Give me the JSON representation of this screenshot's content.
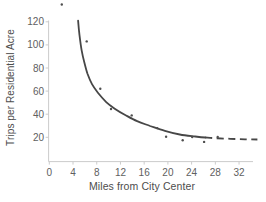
{
  "colors": {
    "background": "#ffffff",
    "curve": "#474747",
    "point": "#4f4f4f",
    "axis_line": "#cccccc",
    "tick_label": "#606060",
    "axis_label": "#4d4d4d"
  },
  "chart_data": {
    "type": "scatter",
    "title": "",
    "xlabel": "Miles from City Center",
    "ylabel": "Trips per Residential Acre",
    "xlim": [
      0,
      36.5
    ],
    "ylim": [
      0,
      122
    ],
    "x_ticks": [
      0,
      4,
      8,
      12,
      16,
      20,
      24,
      28,
      32
    ],
    "y_ticks": [
      20,
      40,
      60,
      80,
      100,
      120
    ],
    "grid": false,
    "legend": false,
    "points": [
      [
        2.1,
        135
      ],
      [
        6.3,
        103
      ],
      [
        8.6,
        62
      ],
      [
        10.4,
        44.5
      ],
      [
        13.9,
        39
      ],
      [
        18.2,
        28
      ],
      [
        19.7,
        20.5
      ],
      [
        22.5,
        17.5
      ],
      [
        24.1,
        20.3
      ],
      [
        26.1,
        16
      ],
      [
        28.4,
        20.3
      ]
    ],
    "fitted_curve": {
      "description": "decaying hyperbola-like fit, solid to ~26 miles then dashed, asymptote near 18 trips",
      "solid": [
        [
          4.85,
          121
        ],
        [
          5.1,
          108.5
        ],
        [
          5.45,
          95.5
        ],
        [
          5.9,
          85
        ],
        [
          6.45,
          75
        ],
        [
          7.2,
          66
        ],
        [
          8.2,
          58.5
        ],
        [
          9.6,
          50.5
        ],
        [
          11.1,
          44.5
        ],
        [
          12.8,
          39.3
        ],
        [
          14.8,
          34
        ],
        [
          17,
          29.8
        ],
        [
          19.5,
          25.5
        ],
        [
          22,
          22.4
        ],
        [
          24.6,
          20.7
        ],
        [
          26.3,
          19.8
        ]
      ],
      "dashed": [
        [
          26.3,
          19.8
        ],
        [
          28,
          19.2
        ],
        [
          30.5,
          18.7
        ],
        [
          33,
          18.3
        ],
        [
          35.1,
          18.1
        ]
      ]
    }
  }
}
